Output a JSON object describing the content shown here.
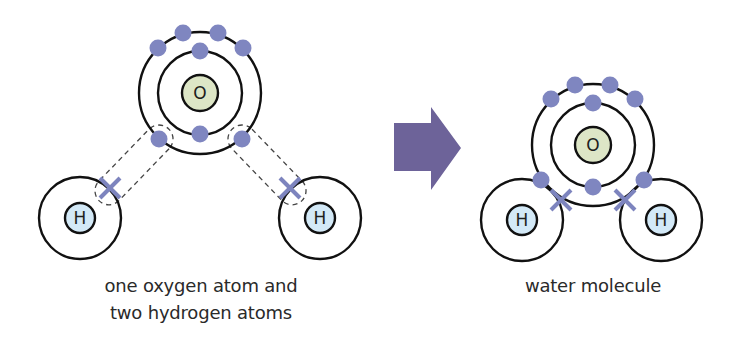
{
  "colors": {
    "electron": "#7f86c0",
    "bond_cross": "#7d84be",
    "oxygen_nucleus": "#dde6c6",
    "hydrogen_nucleus": "#d3e9f7",
    "shell_stroke": "#111111",
    "dashed": "#444444",
    "arrow": "#6d6399"
  },
  "left_panel": {
    "caption_line1": "one oxygen atom and",
    "caption_line2": "two hydrogen atoms",
    "oxygen": {
      "label": "O",
      "cx": 200,
      "cy": 93
    },
    "hydrogen_left": {
      "label": "H",
      "cx": 80,
      "cy": 218
    },
    "hydrogen_right": {
      "label": "H",
      "cx": 320,
      "cy": 218
    }
  },
  "arrow": {
    "direction": "right"
  },
  "right_panel": {
    "caption": "water molecule",
    "oxygen": {
      "label": "O",
      "cx": 593,
      "cy": 145
    },
    "hydrogen_left": {
      "label": "H",
      "cx": 522,
      "cy": 220
    },
    "hydrogen_right": {
      "label": "H",
      "cx": 661,
      "cy": 220
    }
  }
}
